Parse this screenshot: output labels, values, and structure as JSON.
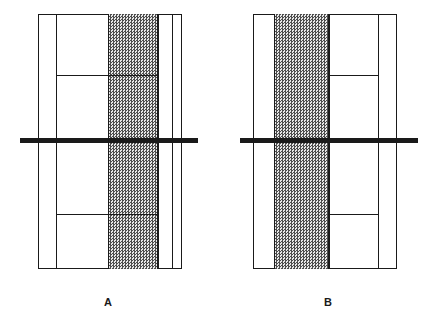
{
  "figure": {
    "width": 433,
    "height": 330,
    "background_color": "#ffffff",
    "line_color": "#1a1a1a",
    "shaded_fill_color": "#b5b5b5"
  },
  "panels": [
    {
      "id": "panel-a",
      "label": "A",
      "label_x": 108,
      "label_y": 296,
      "outer_box": {
        "x": 38,
        "y": 14,
        "width": 144,
        "height": 255
      },
      "vertical_lines": [
        {
          "name": "vline-a-1",
          "x": 56,
          "y": 14,
          "height": 255
        },
        {
          "name": "vline-a-2",
          "x": 158,
          "y": 14,
          "height": 255
        },
        {
          "name": "vline-a-3",
          "x": 172,
          "y": 14,
          "height": 255
        }
      ],
      "shaded_column": {
        "x": 108,
        "y": 14,
        "width": 50,
        "height": 255
      },
      "horizontal_lines": [
        {
          "name": "hline-a-upper",
          "x": 56,
          "y": 75,
          "width": 102
        },
        {
          "name": "hline-a-lower",
          "x": 56,
          "y": 214,
          "width": 102
        }
      ],
      "shaded_ticks": [
        {
          "name": "shaded-tick-a-upper",
          "x": 108,
          "y": 75,
          "width": 50
        },
        {
          "name": "shaded-tick-a-lower",
          "x": 108,
          "y": 214,
          "width": 50
        }
      ],
      "thick_bar": {
        "name": "thick-bar-a",
        "x": 20,
        "y": 138,
        "width": 178,
        "height": 5
      }
    },
    {
      "id": "panel-b",
      "label": "B",
      "label_x": 328,
      "label_y": 296,
      "outer_box": {
        "x": 253,
        "y": 14,
        "width": 144,
        "height": 255
      },
      "vertical_lines": [
        {
          "name": "vline-b-1",
          "x": 274,
          "y": 14,
          "height": 255
        },
        {
          "name": "vline-b-2",
          "x": 329,
          "y": 14,
          "height": 255
        },
        {
          "name": "vline-b-3",
          "x": 378,
          "y": 14,
          "height": 255
        }
      ],
      "shaded_column": {
        "x": 274,
        "y": 14,
        "width": 55,
        "height": 255
      },
      "horizontal_lines": [
        {
          "name": "hline-b-upper",
          "x": 329,
          "y": 75,
          "width": 49
        },
        {
          "name": "hline-b-lower",
          "x": 329,
          "y": 214,
          "width": 49
        }
      ],
      "shaded_ticks": [],
      "thick_bar": {
        "name": "thick-bar-b",
        "x": 240,
        "y": 138,
        "width": 178,
        "height": 5
      }
    }
  ]
}
